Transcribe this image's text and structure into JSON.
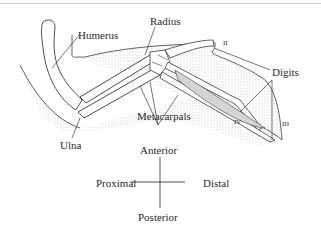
{
  "diagram": {
    "type": "anatomical-illustration",
    "labels": {
      "humerus": "Humerus",
      "radius": "Radius",
      "ulna": "Ulna",
      "metacarpals": "Metacarpals",
      "digits": "Digits",
      "digit_ii": "II",
      "digit_iii": "III",
      "digit_iv": "IV"
    },
    "orientation": {
      "anterior": "Anterior",
      "posterior": "Posterior",
      "proximal": "Proximal",
      "distal": "Distal"
    },
    "colors": {
      "line": "#3a3a3a",
      "stipple": "#d8d8d8",
      "bone": "#ffffff"
    }
  }
}
